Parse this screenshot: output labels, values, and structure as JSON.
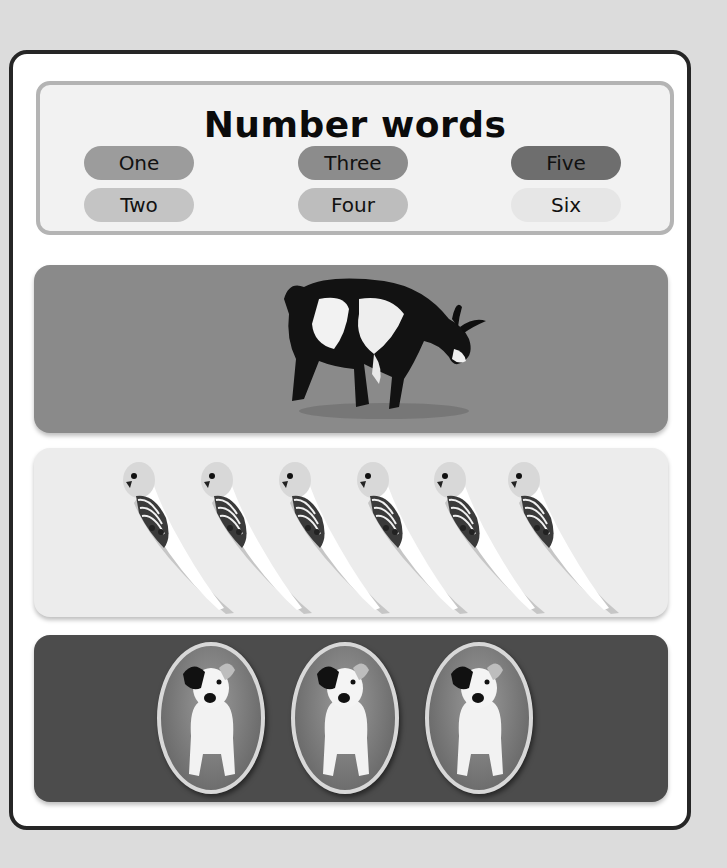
{
  "page": {
    "title": "Number words",
    "number_words": [
      {
        "label": "One",
        "color": "#9c9c9c"
      },
      {
        "label": "Two",
        "color": "#c4c4c4"
      },
      {
        "label": "Three",
        "color": "#8c8c8c"
      },
      {
        "label": "Four",
        "color": "#bdbdbd"
      },
      {
        "label": "Five",
        "color": "#6e6e6e"
      },
      {
        "label": "Six",
        "color": "#e6e6e6"
      }
    ],
    "panels": [
      {
        "animal": "goat",
        "count": 1,
        "background": "#8a8a8a"
      },
      {
        "animal": "budgie",
        "count": 6,
        "background": "#ececec"
      },
      {
        "animal": "dog",
        "count": 3,
        "background": "#4c4c4c"
      }
    ]
  }
}
